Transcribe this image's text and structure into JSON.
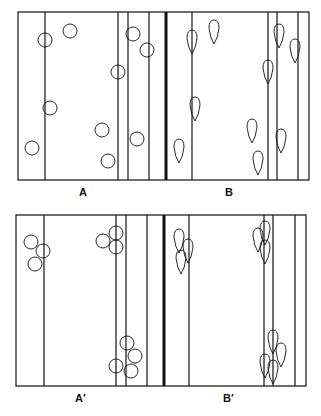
{
  "panels": {
    "top": {
      "label_left": "A",
      "label_right": "B"
    },
    "bottom": {
      "label_left": "A′",
      "label_right": "B′"
    }
  },
  "figure": {
    "line_color": "#111111",
    "background": "#ffffff",
    "top_frame": {
      "x": [
        18,
        309
      ],
      "y": [
        12,
        180
      ],
      "verticals": [
        45,
        118,
        128,
        149,
        166,
        192,
        268,
        277,
        298
      ],
      "thick": [
        166
      ]
    },
    "bottom_frame": {
      "x": [
        16,
        306
      ],
      "y": [
        215,
        386
      ],
      "verticals": [
        44,
        116,
        126,
        147,
        164,
        189,
        264,
        273,
        295
      ],
      "thick": [
        164
      ]
    },
    "A_circles": [
      [
        45,
        40
      ],
      [
        70,
        31
      ],
      [
        118,
        72
      ],
      [
        133,
        34
      ],
      [
        147,
        50
      ],
      [
        50,
        108
      ],
      [
        102,
        130
      ],
      [
        137,
        139
      ],
      [
        32,
        148
      ],
      [
        108,
        161
      ]
    ],
    "B_drops": [
      [
        192,
        42
      ],
      [
        214,
        32
      ],
      [
        279,
        36
      ],
      [
        295,
        51
      ],
      [
        268,
        72
      ],
      [
        195,
        109
      ],
      [
        252,
        131
      ],
      [
        281,
        141
      ],
      [
        179,
        151
      ],
      [
        258,
        163
      ]
    ],
    "Aprime_circles": [
      [
        31,
        242
      ],
      [
        43,
        251
      ],
      [
        35,
        264
      ],
      [
        116,
        233
      ],
      [
        103,
        241
      ],
      [
        116,
        247
      ],
      [
        127,
        343
      ],
      [
        135,
        356
      ],
      [
        116,
        366
      ],
      [
        131,
        371
      ]
    ],
    "Bprime_drops": [
      [
        179,
        241
      ],
      [
        188,
        251
      ],
      [
        181,
        262
      ],
      [
        265,
        233
      ],
      [
        258,
        240
      ],
      [
        265,
        252
      ],
      [
        273,
        342
      ],
      [
        281,
        355
      ],
      [
        265,
        366
      ],
      [
        273,
        372
      ]
    ]
  }
}
